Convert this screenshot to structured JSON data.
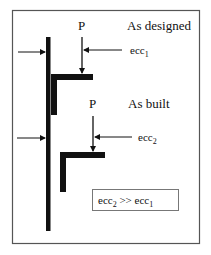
{
  "diagram": {
    "labels": {
      "as_designed": "As designed",
      "as_built": "As built",
      "load_designed": "P",
      "load_built": "P",
      "ecc1_base": "ecc",
      "ecc1_sub": "1",
      "ecc2_base": "ecc",
      "ecc2_sub": "2"
    },
    "comparison": {
      "left_base": "ecc",
      "left_sub": "2",
      "operator": " >> ",
      "right_base": "ecc",
      "right_sub": "1"
    },
    "colors": {
      "stroke": "#111111",
      "frame": "#555555",
      "background": "#ffffff"
    }
  }
}
